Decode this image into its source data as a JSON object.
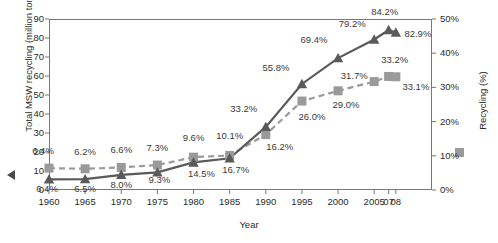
{
  "chart_data": {
    "type": "line",
    "title": "",
    "xlabel": "Year",
    "categories": [
      "1960",
      "1965",
      "1970",
      "1975",
      "1980",
      "1985",
      "1990",
      "1995",
      "2000",
      "2005",
      "07",
      "08"
    ],
    "x_values": [
      1960,
      1965,
      1970,
      1975,
      1980,
      1985,
      1990,
      1995,
      2000,
      2005,
      2007,
      2008
    ],
    "series": [
      {
        "name": "Total MSW recycling (million tons)",
        "axis": "left",
        "marker": "triangle",
        "line_style": "solid",
        "color": "#5a5a5a",
        "unit": "million tons",
        "values": [
          5.6,
          5.7,
          8.0,
          9.3,
          14.5,
          16.7,
          33.2,
          55.8,
          69.4,
          79.2,
          84.2,
          82.9
        ],
        "labels": [
          "6.4%",
          "6.5%",
          "8.0%",
          "9.3%",
          "14.5%",
          "16.7%",
          "33.2%",
          "55.8%",
          "69.4%",
          "79.2%",
          "84.2%",
          "82.9%"
        ]
      },
      {
        "name": "Recycling (%)",
        "axis": "right",
        "marker": "square",
        "line_style": "dashed",
        "color": "#9a9a9a",
        "unit": "%",
        "values": [
          6.4,
          6.2,
          6.6,
          7.3,
          9.6,
          10.1,
          16.2,
          26.0,
          29.0,
          31.7,
          33.2,
          33.1
        ],
        "labels": [
          "6.4%",
          "6.2%",
          "6.6%",
          "7.3%",
          "9.6%",
          "10.1%",
          "16.2%",
          "26.0%",
          "29.0%",
          "31.7%",
          "33.2%",
          "33.1%"
        ]
      }
    ],
    "y_left": {
      "label": "Total MSW recycling (million tons)",
      "ticks": [
        "0",
        "10",
        "20",
        "30",
        "40",
        "50",
        "60",
        "70",
        "80",
        "90"
      ],
      "min": 0,
      "max": 90
    },
    "y_right": {
      "label": "Recycling (%)",
      "ticks": [
        "0%",
        "10%",
        "20%",
        "30%",
        "40%",
        "50%"
      ],
      "min": 0,
      "max": 50
    },
    "grid": false,
    "legend_position": "axis-titles"
  }
}
